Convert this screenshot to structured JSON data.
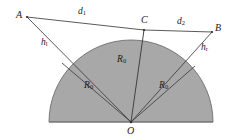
{
  "figure": {
    "colors": {
      "shading": "#a8a8a8",
      "stroke": "#3c3c3c",
      "background": "#ffffff",
      "label_text": "#1a1a1a"
    },
    "points": [
      {
        "id": "A",
        "label": "A",
        "x": 27,
        "y": 17
      },
      {
        "id": "C",
        "label": "C",
        "x": 144,
        "y": 30
      },
      {
        "id": "B",
        "label": "B",
        "x": 212,
        "y": 32
      },
      {
        "id": "O",
        "label": "O",
        "x": 131,
        "y": 122
      }
    ],
    "point_labels": [
      {
        "name": "point-label-a",
        "text": "A",
        "x": 16,
        "y": 12
      },
      {
        "name": "point-label-c",
        "text": "C",
        "x": 141,
        "y": 18
      },
      {
        "name": "point-label-b",
        "text": "B",
        "x": 214,
        "y": 26
      },
      {
        "name": "point-label-o",
        "text": "O",
        "x": 127,
        "y": 127
      }
    ],
    "segment_labels": [
      {
        "name": "segment-label-d1",
        "base": "d",
        "sub": "1",
        "x": 78,
        "y": 9
      },
      {
        "name": "segment-label-d2",
        "base": "d",
        "sub": "2",
        "x": 177,
        "y": 20
      },
      {
        "name": "segment-label-hl",
        "base": "h",
        "sub": "l",
        "x": 41,
        "y": 41
      },
      {
        "name": "segment-label-hr",
        "base": "h",
        "sub": "r",
        "x": 200,
        "y": 46
      },
      {
        "name": "segment-label-r0-center",
        "base": "R",
        "sub": "0",
        "x": 117,
        "y": 58
      },
      {
        "name": "segment-label-r0-left",
        "base": "R",
        "sub": "0",
        "x": 84,
        "y": 84
      },
      {
        "name": "segment-label-r0-right",
        "base": "R",
        "sub": "0",
        "x": 158,
        "y": 84
      }
    ],
    "semicircle": {
      "center_x": 131,
      "center_y": 122,
      "radius": 82,
      "baseline_y": 122,
      "left_x": 49,
      "right_x": 213
    },
    "segments": [
      {
        "name": "chord-a-to-c",
        "from": "A",
        "to": "C",
        "label": "d1"
      },
      {
        "name": "chord-c-to-b",
        "from": "C",
        "to": "B",
        "label": "d2"
      },
      {
        "name": "ray-a-to-o",
        "from": "A",
        "to": "O",
        "label": "hl"
      },
      {
        "name": "ray-b-to-o",
        "from": "B",
        "to": "O",
        "label": "hr"
      },
      {
        "name": "radius-c-to-o",
        "from": "C",
        "to": "O",
        "label": "R0"
      },
      {
        "name": "radius-left",
        "from": "arc-left",
        "to": "O",
        "label": "R0"
      },
      {
        "name": "radius-right",
        "from": "arc-right",
        "to": "O",
        "label": "R0"
      }
    ]
  }
}
